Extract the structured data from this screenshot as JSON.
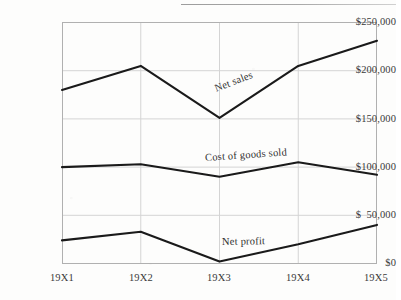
{
  "page": {
    "running_head": "",
    "background_color": "#fdfdfc"
  },
  "axis": {
    "y_tick_labels": [
      "$250,000",
      "$200,000",
      "$150,000",
      "$100,000",
      "$  50,000",
      "$0"
    ],
    "x_tick_labels": [
      "19X1",
      "19X2",
      "19X3",
      "19X4",
      "19X5"
    ]
  },
  "labels": {
    "net_sales": "Net sales",
    "cost_of_goods_sold": "Cost of goods sold",
    "net_profit": "Net profit"
  },
  "colors": {
    "line": "#1a1a1a",
    "grid": "#d0d0d0",
    "axis": "#a8a8a8",
    "text": "#2f2f2f"
  },
  "chart_data": {
    "type": "line",
    "title": "",
    "xlabel": "",
    "ylabel": "",
    "categories": [
      "19X1",
      "19X2",
      "19X3",
      "19X4",
      "19X5"
    ],
    "ylim": [
      0,
      250000
    ],
    "ytick_values": [
      250000,
      200000,
      150000,
      100000,
      50000,
      0
    ],
    "ytick_labels": [
      "$250,000",
      "$200,000",
      "$150,000",
      "$100,000",
      "$  50,000",
      "$0"
    ],
    "grid": true,
    "grid_axes": "both",
    "legend": "inline-annotations",
    "series": [
      {
        "name": "Net sales",
        "values": [
          180000,
          205000,
          151000,
          205000,
          231000
        ],
        "color": "#1a1a1a"
      },
      {
        "name": "Cost of goods sold",
        "values": [
          100000,
          103000,
          90000,
          105000,
          92000
        ],
        "color": "#1a1a1a"
      },
      {
        "name": "Net profit",
        "values": [
          24000,
          33000,
          2000,
          20000,
          40000
        ],
        "color": "#1a1a1a"
      }
    ],
    "annotations": [
      {
        "text": "Net sales",
        "near_category": "19X3",
        "rotation_deg": -21
      },
      {
        "text": "Cost of goods sold",
        "near_category": "19X3",
        "rotation_deg": -4
      },
      {
        "text": "Net profit",
        "near_category": "19X3",
        "rotation_deg": -1
      }
    ]
  }
}
